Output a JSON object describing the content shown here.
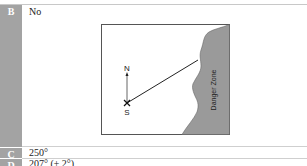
{
  "rows": [
    {
      "label": "B",
      "text": "No"
    },
    {
      "label": "C",
      "text": "250°"
    },
    {
      "label": "D",
      "text": "207° (± 2°)"
    }
  ],
  "diagram": {
    "north_label": "N",
    "south_label": "S",
    "zone_label": "Danger Zone",
    "zone_color": "#9a9a9a",
    "border_color": "#555555"
  },
  "colors": {
    "label_column": "#a3a3a3",
    "divider": "#cfcfcf"
  }
}
